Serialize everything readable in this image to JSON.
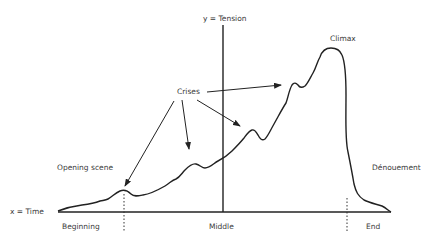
{
  "axes": {
    "y_label": "y = Tension",
    "x_label": "x = Time"
  },
  "x_markers": {
    "beginning": "Beginning",
    "middle": "Middle",
    "end": "End"
  },
  "annotations": {
    "climax": "Climax",
    "crises": "Crises",
    "opening_scene": "Opening scene",
    "denouement": "Dénouement"
  },
  "colors": {
    "line": "#222222",
    "text": "#3a3a3a",
    "background": "#ffffff"
  }
}
